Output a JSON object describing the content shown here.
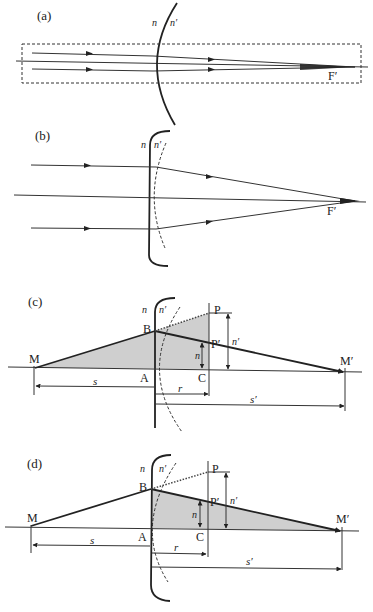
{
  "figure": {
    "panels": [
      {
        "id": "a",
        "label": "(a)",
        "medium_left": "n",
        "medium_right": "n′",
        "focus_label": "F′",
        "description": "Parallel rays near the axis refract at a convex spherical surface and converge to the focal point F′; dashed box marks the paraxial region"
      },
      {
        "id": "b",
        "label": "(b)",
        "medium_left": "n",
        "medium_right": "n′",
        "focus_label": "F′",
        "description": "Enlarged paraxial region: surface approximated by a plane, dashed arc shows the true spherical surface"
      },
      {
        "id": "c",
        "label": "(c)",
        "medium_left": "n",
        "medium_right": "n′",
        "points": [
          "M",
          "A",
          "B",
          "C",
          "P",
          "P′",
          "M′"
        ],
        "heights": {
          "CP_prime": "n",
          "CP": "n′"
        },
        "distances": {
          "MA": "s",
          "AC": "r",
          "AM_prime": "s′"
        }
      },
      {
        "id": "d",
        "label": "(d)",
        "medium_left": "n",
        "medium_right": "n′",
        "points": [
          "M",
          "A",
          "B",
          "C",
          "P",
          "P′",
          "M′"
        ],
        "heights": {
          "CP_prime": "n",
          "CP": "n′"
        },
        "distances": {
          "MA": "s",
          "AC": "r",
          "AM_prime": "s′"
        }
      }
    ]
  },
  "labels": {
    "a": {
      "panel": "(a)",
      "n": "n",
      "np": "n′",
      "F": "F′"
    },
    "b": {
      "panel": "(b)",
      "n": "n",
      "np": "n′",
      "F": "F′"
    },
    "c": {
      "panel": "(c)",
      "n": "n",
      "np": "n′",
      "M": "M",
      "A": "A",
      "B": "B",
      "C": "C",
      "P": "P",
      "Pp": "P′",
      "Mp": "M′",
      "h_n": "n",
      "h_np": "n′",
      "s": "s",
      "r": "r",
      "sp": "s′"
    },
    "d": {
      "panel": "(d)",
      "n": "n",
      "np": "n′",
      "M": "M",
      "A": "A",
      "B": "B",
      "C": "C",
      "P": "P",
      "Pp": "P′",
      "Mp": "M′",
      "h_n": "n",
      "h_np": "n′",
      "s": "s",
      "r": "r",
      "sp": "s′"
    }
  },
  "colors": {
    "line": "#222222",
    "shade": "#cfcfcf",
    "background": "#ffffff"
  }
}
